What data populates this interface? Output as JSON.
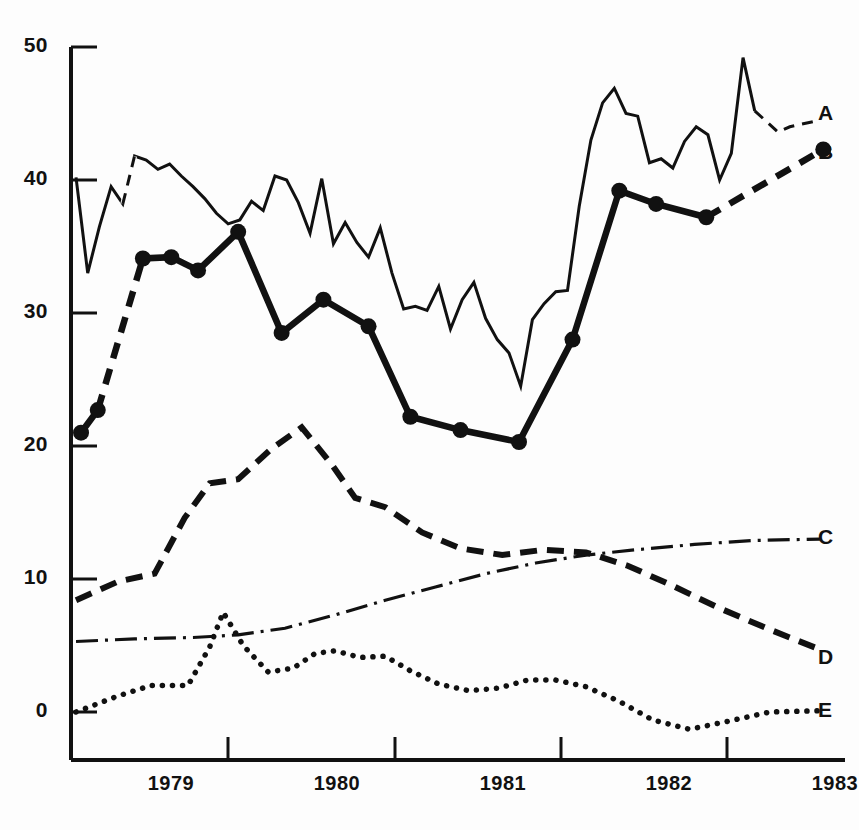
{
  "chart_data": {
    "type": "line",
    "title": "",
    "subtitle": "",
    "xlabel": "",
    "ylabel": "",
    "xlim": [
      1978.62,
      1983.25
    ],
    "ylim": [
      -3,
      50
    ],
    "grid": false,
    "legend_position": "right-of-plot-line-ends",
    "x_tick_values": [
      1979,
      1980,
      1981,
      1982,
      1983
    ],
    "x_tick_labels": [
      "1979",
      "1980",
      "1981",
      "1982",
      "1983"
    ],
    "y_tick_values": [
      0,
      10,
      20,
      30,
      40,
      50
    ],
    "y_tick_labels": [
      "0",
      "10",
      "20",
      "30",
      "40",
      "50"
    ],
    "series": [
      {
        "name": "A",
        "label": "A",
        "style": "solid-thin",
        "marker": "none",
        "forecast_style": "dashed",
        "x": [
          1978.65,
          1978.72,
          1978.79,
          1978.86,
          1978.93,
          1979.0,
          1979.07,
          1979.14,
          1979.21,
          1979.28,
          1979.35,
          1979.42,
          1979.49,
          1979.56,
          1979.63,
          1979.7,
          1979.77,
          1979.84,
          1979.91,
          1979.98,
          1980.05,
          1980.12,
          1980.19,
          1980.26,
          1980.33,
          1980.4,
          1980.47,
          1980.54,
          1980.61,
          1980.68,
          1980.75,
          1980.82,
          1980.89,
          1980.96,
          1981.03,
          1981.1,
          1981.17,
          1981.24,
          1981.31,
          1981.38,
          1981.45,
          1981.52,
          1981.59,
          1981.66,
          1981.73,
          1981.8,
          1981.87,
          1981.94,
          1982.01,
          1982.08,
          1982.15,
          1982.22,
          1982.29,
          1982.36,
          1982.43,
          1982.5,
          1982.57,
          1982.64,
          1982.71,
          1982.78,
          1982.85,
          1982.92,
          1982.99,
          1983.1
        ],
        "y": [
          40.2,
          33.0,
          36.5,
          39.5,
          38.2,
          41.8,
          41.5,
          40.8,
          41.2,
          40.3,
          39.5,
          38.6,
          37.5,
          36.7,
          37.0,
          38.4,
          37.7,
          40.3,
          40.0,
          38.3,
          36.0,
          40.1,
          35.2,
          36.8,
          35.3,
          34.2,
          36.4,
          33.0,
          30.3,
          30.5,
          30.2,
          32.0,
          28.8,
          31.0,
          32.3,
          29.6,
          28.0,
          27.0,
          24.5,
          29.5,
          30.7,
          31.6,
          31.7,
          38.0,
          43.0,
          45.8,
          46.9,
          45.0,
          44.8,
          41.3,
          41.6,
          40.9,
          42.9,
          44.0,
          43.4,
          40.0,
          42.0,
          49.2,
          45.2,
          44.4,
          43.6,
          44.0,
          44.2,
          44.5
        ],
        "forecast_from_index": 58
      },
      {
        "name": "B",
        "label": "B",
        "style": "solid-thick",
        "marker": "filled-circle",
        "forecast_style": "dashed",
        "x": [
          1978.68,
          1978.78,
          1979.05,
          1979.22,
          1979.38,
          1979.62,
          1979.88,
          1980.13,
          1980.4,
          1980.65,
          1980.95,
          1981.3,
          1981.62,
          1981.9,
          1982.12,
          1982.42,
          1983.12
        ],
        "y": [
          21.0,
          22.7,
          34.1,
          34.2,
          33.2,
          36.1,
          28.5,
          31.0,
          29.0,
          22.2,
          21.2,
          20.3,
          28.0,
          39.2,
          38.2,
          37.2,
          42.3
        ],
        "forecast_from_index": 15
      },
      {
        "name": "C",
        "label": "C",
        "style": "dash-dot",
        "marker": "none",
        "x": [
          1978.65,
          1979.0,
          1979.35,
          1979.62,
          1979.9,
          1980.2,
          1980.5,
          1980.8,
          1981.1,
          1981.4,
          1981.7,
          1982.0,
          1982.35,
          1982.7,
          1983.1
        ],
        "y": [
          5.3,
          5.5,
          5.6,
          5.8,
          6.3,
          7.3,
          8.4,
          9.4,
          10.4,
          11.2,
          11.8,
          12.2,
          12.6,
          12.9,
          13.0
        ]
      },
      {
        "name": "D",
        "label": "D",
        "style": "dashed-heavy",
        "marker": "none",
        "x": [
          1978.65,
          1978.9,
          1979.12,
          1979.3,
          1979.45,
          1979.62,
          1979.82,
          1980.0,
          1980.18,
          1980.32,
          1980.5,
          1980.72,
          1980.95,
          1981.2,
          1981.45,
          1981.7,
          1981.95,
          1982.2,
          1982.5,
          1982.8,
          1983.12
        ],
        "y": [
          8.4,
          9.8,
          10.4,
          14.6,
          17.2,
          17.5,
          19.8,
          21.4,
          18.6,
          16.1,
          15.4,
          13.5,
          12.3,
          11.8,
          12.2,
          12.0,
          11.0,
          9.6,
          7.8,
          6.2,
          4.6
        ]
      },
      {
        "name": "E",
        "label": "E",
        "style": "dotted",
        "marker": "none",
        "x": [
          1978.65,
          1978.9,
          1979.1,
          1979.32,
          1979.45,
          1979.53,
          1979.65,
          1979.8,
          1979.95,
          1980.08,
          1980.2,
          1980.35,
          1980.5,
          1980.65,
          1980.82,
          1981.0,
          1981.18,
          1981.35,
          1981.52,
          1981.7,
          1981.9,
          1982.1,
          1982.32,
          1982.55,
          1982.8,
          1983.12
        ],
        "y": [
          0.0,
          1.2,
          2.0,
          2.0,
          4.9,
          7.5,
          5.0,
          3.0,
          3.3,
          4.4,
          4.6,
          4.1,
          4.2,
          3.1,
          2.1,
          1.6,
          1.8,
          2.4,
          2.4,
          1.9,
          0.8,
          -0.6,
          -1.3,
          -0.7,
          0.0,
          0.1
        ]
      }
    ]
  },
  "axis": {
    "y_labels": [
      "50",
      "40",
      "30",
      "20",
      "10",
      "0"
    ],
    "x_labels": [
      "1979",
      "1980",
      "1981",
      "1982",
      "1983"
    ]
  },
  "series_labels": {
    "a": "A",
    "b": "B",
    "c": "C",
    "d": "D",
    "e": "E"
  },
  "colors": {
    "ink": "#111111",
    "background": "#fdfdfd"
  }
}
